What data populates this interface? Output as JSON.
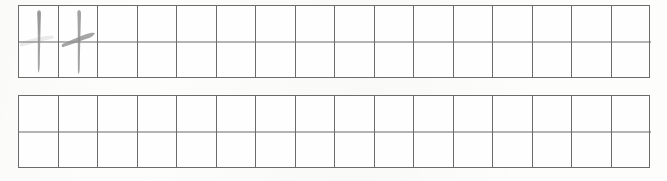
{
  "worksheet": {
    "title": "Chinese character handwriting practice grid",
    "background_color": "#fdfdfc",
    "grid_line_color": "#6b6b6b",
    "ink_color": "#8e8e8e",
    "rows": [
      {
        "row_label": "practice-row-1",
        "columns": 16,
        "cells": [
          {
            "index": 1,
            "content": "丨",
            "stroke_type": "vertical-stroke",
            "has_ghost_mark": true,
            "ghost_note": "faint erased horizontal stroke"
          },
          {
            "index": 2,
            "content": "十",
            "stroke_type": "cross-character",
            "has_ghost_mark": false
          },
          {
            "index": 3,
            "content": "",
            "stroke_type": "empty",
            "has_ghost_mark": false
          },
          {
            "index": 4,
            "content": "",
            "stroke_type": "empty",
            "has_ghost_mark": false
          },
          {
            "index": 5,
            "content": "",
            "stroke_type": "empty",
            "has_ghost_mark": false
          },
          {
            "index": 6,
            "content": "",
            "stroke_type": "empty",
            "has_ghost_mark": false
          },
          {
            "index": 7,
            "content": "",
            "stroke_type": "empty",
            "has_ghost_mark": false
          },
          {
            "index": 8,
            "content": "",
            "stroke_type": "empty",
            "has_ghost_mark": false
          },
          {
            "index": 9,
            "content": "",
            "stroke_type": "empty",
            "has_ghost_mark": false
          },
          {
            "index": 10,
            "content": "",
            "stroke_type": "empty",
            "has_ghost_mark": false
          },
          {
            "index": 11,
            "content": "",
            "stroke_type": "empty",
            "has_ghost_mark": false
          },
          {
            "index": 12,
            "content": "",
            "stroke_type": "empty",
            "has_ghost_mark": false
          },
          {
            "index": 13,
            "content": "",
            "stroke_type": "empty",
            "has_ghost_mark": false
          },
          {
            "index": 14,
            "content": "",
            "stroke_type": "empty",
            "has_ghost_mark": false
          },
          {
            "index": 15,
            "content": "",
            "stroke_type": "empty",
            "has_ghost_mark": false
          },
          {
            "index": 16,
            "content": "",
            "stroke_type": "empty",
            "has_ghost_mark": false
          }
        ]
      },
      {
        "row_label": "practice-row-2",
        "columns": 16,
        "cells": [
          {
            "index": 1,
            "content": "",
            "stroke_type": "empty",
            "has_ghost_mark": false
          },
          {
            "index": 2,
            "content": "",
            "stroke_type": "empty",
            "has_ghost_mark": false
          },
          {
            "index": 3,
            "content": "",
            "stroke_type": "empty",
            "has_ghost_mark": false
          },
          {
            "index": 4,
            "content": "",
            "stroke_type": "empty",
            "has_ghost_mark": false
          },
          {
            "index": 5,
            "content": "",
            "stroke_type": "empty",
            "has_ghost_mark": false
          },
          {
            "index": 6,
            "content": "",
            "stroke_type": "empty",
            "has_ghost_mark": false
          },
          {
            "index": 7,
            "content": "",
            "stroke_type": "empty",
            "has_ghost_mark": false
          },
          {
            "index": 8,
            "content": "",
            "stroke_type": "empty",
            "has_ghost_mark": false
          },
          {
            "index": 9,
            "content": "",
            "stroke_type": "empty",
            "has_ghost_mark": false
          },
          {
            "index": 10,
            "content": "",
            "stroke_type": "empty",
            "has_ghost_mark": false
          },
          {
            "index": 11,
            "content": "",
            "stroke_type": "empty",
            "has_ghost_mark": false
          },
          {
            "index": 12,
            "content": "",
            "stroke_type": "empty",
            "has_ghost_mark": false
          },
          {
            "index": 13,
            "content": "",
            "stroke_type": "empty",
            "has_ghost_mark": false
          },
          {
            "index": 14,
            "content": "",
            "stroke_type": "empty",
            "has_ghost_mark": false
          },
          {
            "index": 15,
            "content": "",
            "stroke_type": "empty",
            "has_ghost_mark": false
          },
          {
            "index": 16,
            "content": "",
            "stroke_type": "empty",
            "has_ghost_mark": false
          }
        ]
      }
    ]
  },
  "geometry": {
    "row1_top": 5,
    "row1_bottom": 78,
    "row2_top": 95,
    "row2_bottom": 168,
    "grid_left": 18,
    "grid_right": 650
  }
}
